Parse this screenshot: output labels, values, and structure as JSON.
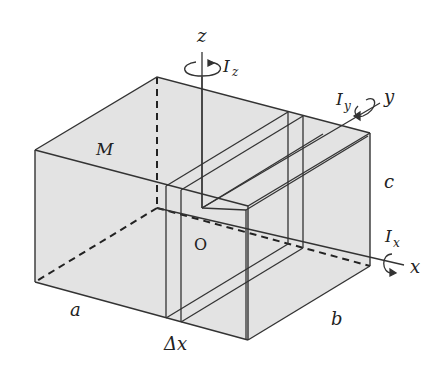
{
  "figure": {
    "type": "3D rectangular box (cuboid) with thin slab element and rotation axes",
    "labels": {
      "mass": "M",
      "origin": "O",
      "axis_x": "x",
      "axis_y": "y",
      "axis_z": "z",
      "moment_x": "I",
      "moment_x_sub": "x",
      "moment_y": "I",
      "moment_y_sub": "y",
      "moment_z": "I",
      "moment_z_sub": "z",
      "edge_a": "a",
      "edge_b": "b",
      "edge_c": "c",
      "slab_width": "Δx"
    },
    "colors": {
      "face_fill": "#e3e3e3",
      "stroke": "#333333",
      "background": "#ffffff"
    }
  }
}
